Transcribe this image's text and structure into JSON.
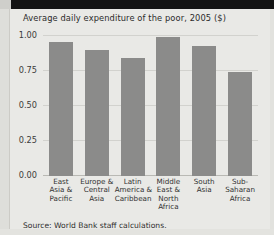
{
  "chart_data": {
    "type": "bar",
    "title": "Average daily expenditure of the poor, 2005 ($)",
    "xlabel": "",
    "ylabel": "",
    "categories": [
      "East Asia & Pacific",
      "Europe & Central Asia",
      "Latin America & Caribbean",
      "Middle East & North Africa",
      "South Asia",
      "Sub-Saharan Africa"
    ],
    "category_lines": [
      [
        "East",
        "Asia &",
        "Pacific"
      ],
      [
        "Europe &",
        "Central",
        "Asia"
      ],
      [
        "Latin",
        "America &",
        "Caribbean"
      ],
      [
        "Middle",
        "East &",
        "North",
        "Africa"
      ],
      [
        "South",
        "Asia"
      ],
      [
        "Sub-",
        "Saharan",
        "Africa"
      ]
    ],
    "values": [
      0.96,
      0.9,
      0.84,
      0.99,
      0.93,
      0.74
    ],
    "ylim": [
      0,
      1.0
    ],
    "yticks": [
      1.0,
      0.75,
      0.5,
      0.25,
      0.0
    ],
    "ytick_labels": [
      "1.00",
      "0.75",
      "0.50",
      "0.25",
      "0.00"
    ],
    "grid": true,
    "legend": false,
    "bar_color": "#8b8b8a",
    "background_color": "#e9e9e6",
    "gridline_color": "#d2d2ce"
  },
  "source_note": "Source: World Bank staff calculations."
}
